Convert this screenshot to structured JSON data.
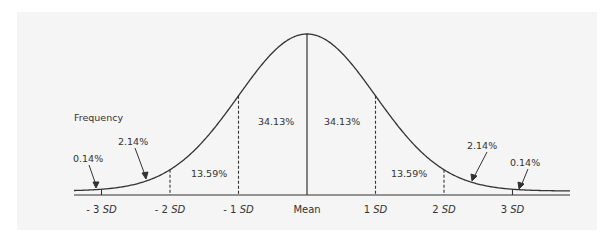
{
  "diagram": {
    "y_label": "Frequency",
    "x_ticks": [
      {
        "prefix": "- 3 ",
        "unit": "SD",
        "sd": -3
      },
      {
        "prefix": "- 2 ",
        "unit": "SD",
        "sd": -2
      },
      {
        "prefix": "- 1 ",
        "unit": "SD",
        "sd": -1
      },
      {
        "prefix": "Mean",
        "unit": "",
        "sd": 0
      },
      {
        "prefix": "1 ",
        "unit": "SD",
        "sd": 1
      },
      {
        "prefix": "2 ",
        "unit": "SD",
        "sd": 2
      },
      {
        "prefix": "3 ",
        "unit": "SD",
        "sd": 3
      }
    ],
    "regions": [
      {
        "range": "-inf to -3SD",
        "label": "0.14%"
      },
      {
        "range": "-3SD to -2SD",
        "label": "2.14%"
      },
      {
        "range": "-2SD to -1SD",
        "label": "13.59%"
      },
      {
        "range": "-1SD to Mean",
        "label": "34.13%"
      },
      {
        "range": "Mean to 1SD",
        "label": "34.13%"
      },
      {
        "range": "1SD to 2SD",
        "label": "13.59%"
      },
      {
        "range": "2SD to 3SD",
        "label": "2.14%"
      },
      {
        "range": "3SD to +inf",
        "label": "0.14%"
      }
    ],
    "colors": {
      "background": "#f5f5f5",
      "line": "#333333",
      "text": "#333333"
    }
  }
}
